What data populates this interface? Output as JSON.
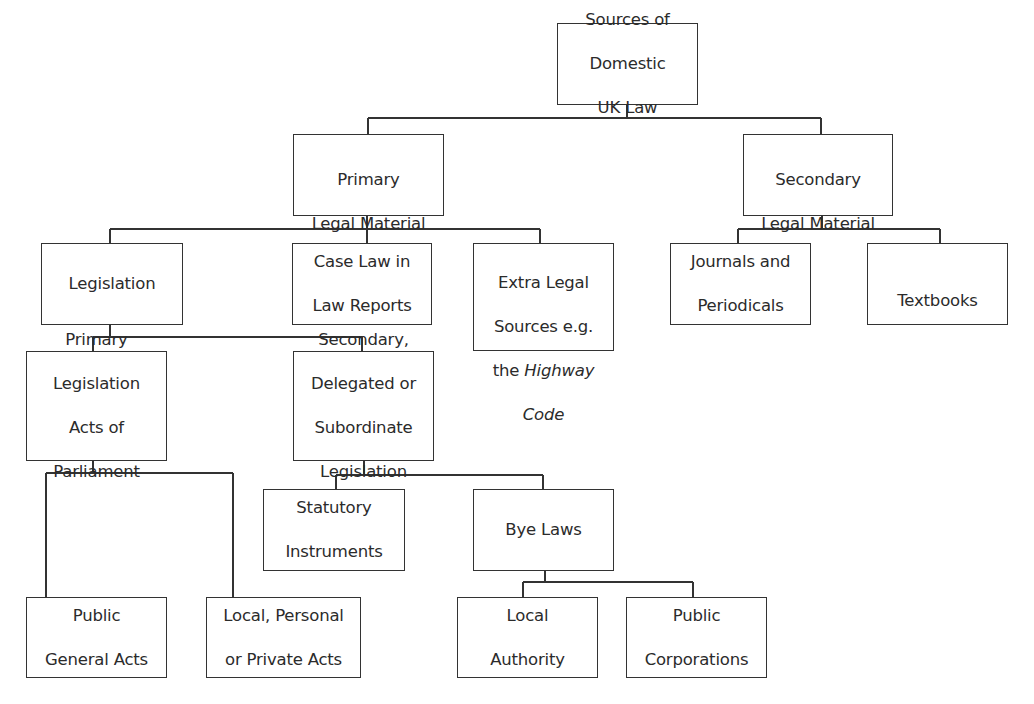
{
  "diagram": {
    "type": "hierarchy-tree",
    "title": "Sources of Domestic UK Law",
    "colors": {
      "line": "#333333",
      "text": "#2b2b2b",
      "background": "#ffffff"
    },
    "nodes": {
      "root": {
        "lines": [
          "Sources of",
          "Domestic",
          "UK Law"
        ]
      },
      "primary_legal_material": {
        "lines": [
          "Primary",
          "Legal Material"
        ]
      },
      "secondary_legal_material": {
        "lines": [
          "Secondary",
          "Legal Material"
        ]
      },
      "legislation": {
        "lines": [
          "Legislation"
        ]
      },
      "case_law": {
        "lines": [
          "Case Law in",
          "Law Reports"
        ]
      },
      "extra_legal": {
        "lines": [
          "Extra Legal",
          "Sources e.g.",
          "the",
          "Highway",
          "Code"
        ],
        "italic_text": "Highway Code"
      },
      "journals": {
        "lines": [
          "Journals and",
          "Periodicals"
        ]
      },
      "textbooks": {
        "lines": [
          "Textbooks"
        ]
      },
      "primary_legislation": {
        "lines": [
          "Primary",
          "Legislation",
          "Acts of",
          "Parliament"
        ]
      },
      "secondary_legislation": {
        "lines": [
          "Secondary,",
          "Delegated or",
          "Subordinate",
          "Legislation"
        ]
      },
      "statutory_instruments": {
        "lines": [
          "Statutory",
          "Instruments"
        ]
      },
      "bye_laws": {
        "lines": [
          "Bye Laws"
        ]
      },
      "public_general_acts": {
        "lines": [
          "Public",
          "General Acts"
        ]
      },
      "local_personal_private": {
        "lines": [
          "Local, Personal",
          "or Private Acts"
        ]
      },
      "local_authority": {
        "lines": [
          "Local",
          "Authority"
        ]
      },
      "public_corporations": {
        "lines": [
          "Public",
          "Corporations"
        ]
      }
    },
    "edges": [
      [
        "root",
        "primary_legal_material"
      ],
      [
        "root",
        "secondary_legal_material"
      ],
      [
        "primary_legal_material",
        "legislation"
      ],
      [
        "primary_legal_material",
        "case_law"
      ],
      [
        "primary_legal_material",
        "extra_legal"
      ],
      [
        "secondary_legal_material",
        "journals"
      ],
      [
        "secondary_legal_material",
        "textbooks"
      ],
      [
        "legislation",
        "primary_legislation"
      ],
      [
        "legislation",
        "secondary_legislation"
      ],
      [
        "primary_legislation",
        "public_general_acts"
      ],
      [
        "primary_legislation",
        "local_personal_private"
      ],
      [
        "secondary_legislation",
        "statutory_instruments"
      ],
      [
        "secondary_legislation",
        "bye_laws"
      ],
      [
        "bye_laws",
        "local_authority"
      ],
      [
        "bye_laws",
        "public_corporations"
      ]
    ]
  }
}
